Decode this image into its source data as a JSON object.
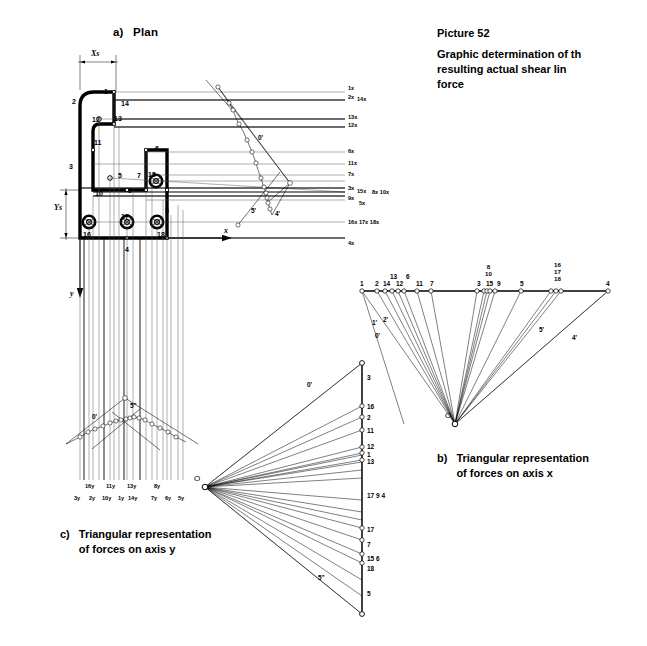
{
  "figure": {
    "picture_number": "Picture 52",
    "caption_lines": [
      "Graphic determination of th",
      "resulting  actual  shear  lin",
      "force"
    ]
  },
  "panels": {
    "a": {
      "letter": "a)",
      "title": "Plan"
    },
    "b": {
      "letter": "b)",
      "title_lines": [
        "Triangular representation",
        "of forces on axis x"
      ]
    },
    "c": {
      "letter": "c)",
      "title_lines": [
        "Triangular representation",
        "of forces on axis y"
      ]
    }
  },
  "plan": {
    "dim_xs": "Xs",
    "dim_ys": "Ys",
    "axis_x": "x",
    "axis_y": "y",
    "outline_labels": [
      {
        "text": "1",
        "x": 104,
        "y": 88
      },
      {
        "text": "2",
        "x": 72,
        "y": 98
      },
      {
        "text": "14",
        "x": 121,
        "y": 100
      },
      {
        "text": "12",
        "x": 92,
        "y": 116
      },
      {
        "text": "13",
        "x": 114,
        "y": 115
      },
      {
        "text": "11",
        "x": 94,
        "y": 139
      },
      {
        "text": "3",
        "x": 69,
        "y": 163
      },
      {
        "text": "6",
        "x": 155,
        "y": 145
      },
      {
        "text": "7",
        "x": 137,
        "y": 172
      },
      {
        "text": "15",
        "x": 148,
        "y": 171
      },
      {
        "text": "5",
        "x": 118,
        "y": 172
      },
      {
        "text": "9",
        "x": 128,
        "y": 187
      },
      {
        "text": "10",
        "x": 95,
        "y": 190
      },
      {
        "text": "17",
        "x": 121,
        "y": 213
      },
      {
        "text": "5",
        "x": 165,
        "y": 207
      },
      {
        "text": "16",
        "x": 83,
        "y": 231
      },
      {
        "text": "18",
        "x": 157,
        "y": 231
      },
      {
        "text": "4",
        "x": 125,
        "y": 246
      }
    ],
    "ray_labels": [
      {
        "text": "1x",
        "x": 348,
        "y": 86,
        "size": "sm"
      },
      {
        "text": "2x",
        "x": 348,
        "y": 95,
        "size": "sm"
      },
      {
        "text": "14x",
        "x": 357,
        "y": 97,
        "size": "sm"
      },
      {
        "text": "13x",
        "x": 348,
        "y": 115,
        "size": "sm"
      },
      {
        "text": "12x",
        "x": 348,
        "y": 123,
        "size": "sm"
      },
      {
        "text": "6x",
        "x": 348,
        "y": 149,
        "size": "sm"
      },
      {
        "text": "11x",
        "x": 348,
        "y": 161,
        "size": "sm"
      },
      {
        "text": "7x",
        "x": 348,
        "y": 172,
        "size": "sm"
      },
      {
        "text": "3x",
        "x": 348,
        "y": 186,
        "size": "sm"
      },
      {
        "text": "15x",
        "x": 357,
        "y": 189,
        "size": "sm"
      },
      {
        "text": "8x 10x",
        "x": 372,
        "y": 190,
        "size": "sm"
      },
      {
        "text": "9x",
        "x": 348,
        "y": 196,
        "size": "sm"
      },
      {
        "text": "5x",
        "x": 359,
        "y": 201,
        "size": "sm"
      },
      {
        "text": "16x 17x 18x",
        "x": 348,
        "y": 220,
        "size": "sm"
      },
      {
        "text": "4x",
        "x": 348,
        "y": 241,
        "size": "sm"
      }
    ],
    "funicular_labels": [
      {
        "text": "0'",
        "x": 258,
        "y": 135
      },
      {
        "text": "5'",
        "x": 251,
        "y": 208
      },
      {
        "text": "4'",
        "x": 275,
        "y": 211
      }
    ],
    "y_funicular_labels": [
      {
        "text": "0'",
        "x": 92,
        "y": 414
      },
      {
        "text": "5\"",
        "x": 130,
        "y": 403
      }
    ],
    "y_force_labels_upper": [
      {
        "text": "16y",
        "x": 85,
        "y": 484
      },
      {
        "text": "11y",
        "x": 106,
        "y": 484
      },
      {
        "text": "13y",
        "x": 127,
        "y": 484
      },
      {
        "text": "8y",
        "x": 154,
        "y": 484
      }
    ],
    "y_force_labels_lower": [
      {
        "text": "3y",
        "x": 74,
        "y": 496
      },
      {
        "text": "2y",
        "x": 89,
        "y": 496
      },
      {
        "text": "10y",
        "x": 102,
        "y": 496
      },
      {
        "text": "1y",
        "x": 118,
        "y": 496
      },
      {
        "text": "14y",
        "x": 128,
        "y": 496
      },
      {
        "text": "7y",
        "x": 151,
        "y": 496
      },
      {
        "text": "6y",
        "x": 165,
        "y": 496
      },
      {
        "text": "5y",
        "x": 178,
        "y": 496
      }
    ]
  },
  "chart_data": [
    {
      "type": "line",
      "name": "b-triangular-forces-axis-x",
      "title": "Triangular representation of forces on axis x",
      "orientation": "horizontal",
      "pole": {
        "label": "O",
        "x": 455,
        "y": 424
      },
      "baseline_y": 291,
      "xlabel": "",
      "ylabel": "",
      "nodes": [
        {
          "label": "1",
          "x": 362
        },
        {
          "label": "2",
          "x": 377
        },
        {
          "label": "14",
          "x": 385
        },
        {
          "label": "13",
          "x": 392
        },
        {
          "label": "12",
          "x": 398
        },
        {
          "label": "6",
          "x": 404
        },
        {
          "label": "11",
          "x": 417
        },
        {
          "label": "7",
          "x": 431
        },
        {
          "label": "3",
          "x": 477
        },
        {
          "label": "8",
          "x": 484
        },
        {
          "label": "10",
          "x": 487
        },
        {
          "label": "15",
          "x": 490
        },
        {
          "label": "9",
          "x": 495
        },
        {
          "label": "5",
          "x": 521
        },
        {
          "label": "16",
          "x": 551
        },
        {
          "label": "17",
          "x": 556
        },
        {
          "label": "18",
          "x": 561
        },
        {
          "label": "4",
          "x": 608
        }
      ],
      "top_labels": [
        {
          "text": "1",
          "x": 360,
          "y": 281
        },
        {
          "text": "2",
          "x": 375,
          "y": 281
        },
        {
          "text": "14",
          "x": 383,
          "y": 281
        },
        {
          "text": "13",
          "x": 390,
          "y": 274
        },
        {
          "text": "12",
          "x": 396,
          "y": 281
        },
        {
          "text": "6",
          "x": 406,
          "y": 274
        },
        {
          "text": "11",
          "x": 416,
          "y": 281
        },
        {
          "text": "7",
          "x": 430,
          "y": 281
        },
        {
          "text": "3",
          "x": 477,
          "y": 281
        },
        {
          "text": "15",
          "x": 486,
          "y": 281
        },
        {
          "text": "9",
          "x": 497,
          "y": 281
        },
        {
          "text": "5",
          "x": 520,
          "y": 281
        },
        {
          "text": "4",
          "x": 606,
          "y": 281
        }
      ],
      "stacked_labels": [
        {
          "lines": [
            "8",
            "10"
          ],
          "x": 485,
          "y": 264
        },
        {
          "lines": [
            "16",
            "17",
            "18"
          ],
          "x": 554,
          "y": 262
        }
      ],
      "ray_labels": [
        {
          "text": "0'",
          "x": 375,
          "y": 333
        },
        {
          "text": "1'",
          "x": 372,
          "y": 320
        },
        {
          "text": "2'",
          "x": 383,
          "y": 317
        },
        {
          "text": "5'",
          "x": 539,
          "y": 327
        },
        {
          "text": "4'",
          "x": 572,
          "y": 335
        }
      ]
    },
    {
      "type": "line",
      "name": "c-triangular-forces-axis-y",
      "title": "Triangular representation of forces on axis y",
      "orientation": "vertical",
      "pole": {
        "label": "O",
        "x": 205,
        "y": 487
      },
      "baseline_x": 362,
      "nodes": [
        {
          "label": "3",
          "y": 363
        },
        {
          "label": "16",
          "y": 406
        },
        {
          "label": "2",
          "y": 417
        },
        {
          "label": "11",
          "y": 430
        },
        {
          "label": "12",
          "y": 447
        },
        {
          "label": "1",
          "y": 453
        },
        {
          "label": "13",
          "y": 460
        },
        {
          "label": "17",
          "y": 528
        },
        {
          "label": "7",
          "y": 540
        },
        {
          "label": "15",
          "y": 554
        },
        {
          "label": "18",
          "y": 563
        },
        {
          "label": "5",
          "y": 614
        }
      ],
      "side_labels": [
        {
          "text": "3",
          "x": 367,
          "y": 375
        },
        {
          "text": "16",
          "x": 367,
          "y": 404
        },
        {
          "text": "2",
          "x": 367,
          "y": 415
        },
        {
          "text": "11",
          "x": 367,
          "y": 428
        },
        {
          "text": "12",
          "x": 367,
          "y": 444
        },
        {
          "text": "1",
          "x": 367,
          "y": 452
        },
        {
          "text": "13",
          "x": 367,
          "y": 459
        },
        {
          "text": "17 9 4",
          "x": 367,
          "y": 493
        },
        {
          "text": "17",
          "x": 367,
          "y": 527
        },
        {
          "text": "7",
          "x": 367,
          "y": 542
        },
        {
          "text": "15 6",
          "x": 367,
          "y": 556
        },
        {
          "text": "18",
          "x": 367,
          "y": 566
        },
        {
          "text": "5",
          "x": 367,
          "y": 591
        }
      ],
      "ray_labels": [
        {
          "text": "0'",
          "x": 307,
          "y": 382
        },
        {
          "text": "5\"",
          "x": 318,
          "y": 575
        }
      ]
    }
  ],
  "colors": {
    "ink": "#000000",
    "thin": "#5a5a5a",
    "faint": "#9a9a9a",
    "background": "#ffffff"
  }
}
